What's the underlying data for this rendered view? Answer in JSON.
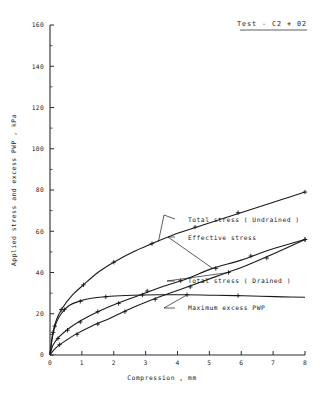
{
  "chart_data": {
    "type": "line",
    "title": "Test - C2 + 02",
    "xlabel": "Compression , mm",
    "ylabel": "Applied stress and excess PWP , kPa",
    "xlim": [
      0,
      8
    ],
    "ylim": [
      0,
      160
    ],
    "xticks": [
      0,
      1,
      2,
      3,
      4,
      5,
      6,
      7,
      8
    ],
    "xticklabels": [
      "0",
      "1",
      "2",
      "3",
      "4",
      "5",
      "6",
      "7",
      "8"
    ],
    "yticks": [
      0,
      20,
      40,
      60,
      80,
      100,
      120,
      140,
      160
    ],
    "yticklabels": [
      "0",
      "20",
      "40",
      "60",
      "80",
      "100",
      "120",
      "140",
      "160"
    ],
    "y_minor_step": 10,
    "grid": false,
    "legend": "inline-annotations",
    "series": [
      {
        "name": "Total stress ( Undrained )",
        "x": [
          0,
          0.08,
          0.2,
          0.4,
          0.7,
          1.05,
          1.5,
          2.0,
          2.6,
          3.2,
          4.0,
          4.8,
          5.6,
          6.4,
          7.2,
          8.0
        ],
        "y": [
          0,
          10,
          17,
          23,
          29,
          34,
          40,
          45,
          50,
          54,
          59,
          63,
          67,
          71,
          75,
          79
        ],
        "markers_x": [
          0.1,
          0.35,
          1.05,
          2.0,
          3.2,
          4.55,
          5.9,
          8.0
        ],
        "markers_y": [
          11,
          22,
          34,
          45,
          54,
          62,
          69,
          79
        ]
      },
      {
        "name": "Effective stress",
        "x": [
          0,
          0.1,
          0.3,
          0.6,
          1.0,
          1.5,
          2.1,
          2.8,
          3.5,
          4.3,
          5.1,
          6.0,
          6.9,
          8.0
        ],
        "y": [
          0,
          5,
          9,
          13,
          17,
          21,
          25,
          29,
          33,
          37,
          42,
          46,
          51,
          56
        ],
        "markers_x": [
          0.25,
          0.55,
          0.95,
          1.5,
          2.15,
          3.05,
          4.1,
          5.2,
          6.3,
          8.0
        ],
        "markers_y": [
          8,
          12,
          16,
          21,
          25,
          31,
          36,
          42,
          48,
          56
        ]
      },
      {
        "name": "Total stress ( Drained )",
        "x": [
          0,
          0.15,
          0.4,
          0.8,
          1.3,
          1.9,
          2.6,
          3.4,
          4.3,
          5.2,
          6.1,
          7.0,
          8.0
        ],
        "y": [
          0,
          3,
          6,
          10,
          14,
          18,
          23,
          28,
          33,
          38,
          43,
          49,
          56
        ],
        "markers_x": [
          0.3,
          0.85,
          1.5,
          2.35,
          3.3,
          4.4,
          5.6,
          6.8,
          8.0
        ],
        "markers_y": [
          5,
          10,
          15,
          21,
          27,
          33,
          40,
          47,
          56
        ]
      },
      {
        "name": "Maximum excess PWP",
        "x": [
          0,
          0.08,
          0.18,
          0.35,
          0.6,
          0.9,
          1.3,
          1.9,
          2.6,
          3.4,
          4.2,
          5.0,
          5.8,
          6.6,
          7.3,
          8.0
        ],
        "y": [
          0,
          9,
          15,
          20,
          24,
          26,
          27.5,
          28.5,
          29,
          29.2,
          29.2,
          29,
          28.8,
          28.5,
          28.2,
          28
        ],
        "markers_x": [
          0.15,
          0.45,
          0.95,
          1.75,
          2.9,
          4.3,
          5.9
        ],
        "markers_y": [
          14,
          22,
          26,
          28.2,
          29.1,
          29.2,
          28.8
        ]
      }
    ],
    "annotations": [
      {
        "label": "Total stress ( Undrained )",
        "tip_x": 3.4,
        "tip_y": 55
      },
      {
        "label": "Effective stress",
        "tip_x": 5.1,
        "tip_y": 42
      },
      {
        "label": "Total stress ( Drained )",
        "tip_x": 5.6,
        "tip_y": 40
      },
      {
        "label": "Maximum excess PWP",
        "tip_x": 4.3,
        "tip_y": 29.2
      }
    ]
  }
}
